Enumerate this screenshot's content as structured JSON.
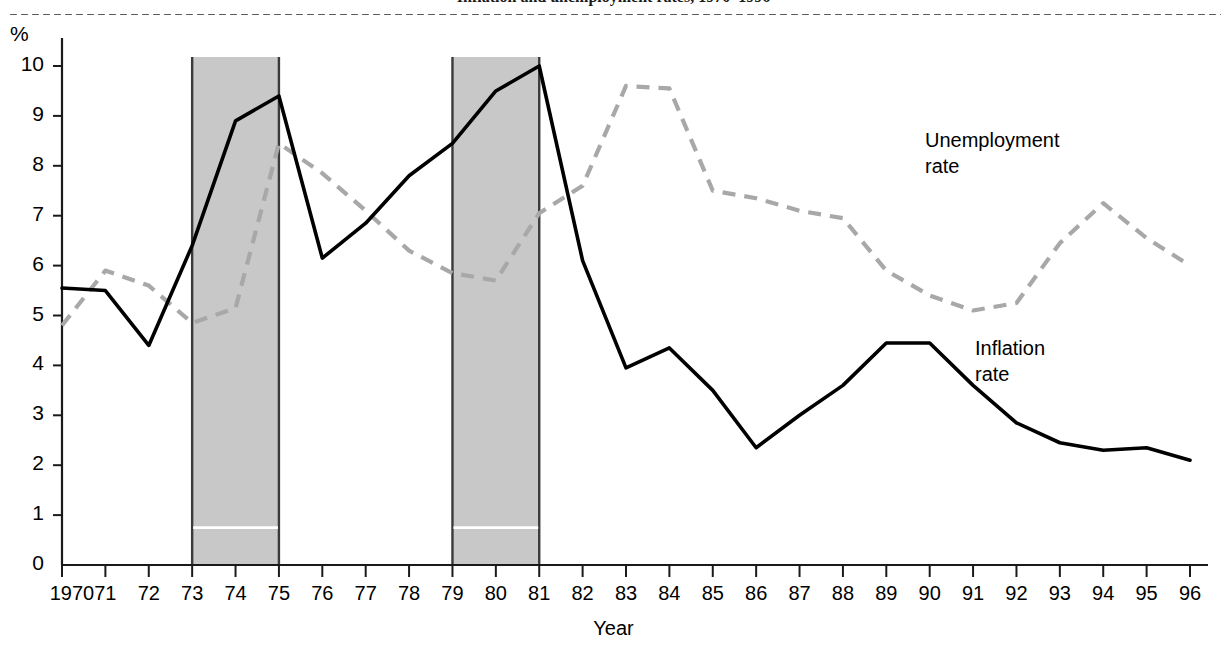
{
  "figure": {
    "title": "Inflation and unemployment rates, 1970–1996",
    "percent_symbol": "%",
    "xlabel": "Year"
  },
  "annotations": {
    "unemployment": {
      "line1": "Unemployment",
      "line2": "rate"
    },
    "inflation": {
      "line1": "Inflation",
      "line2": "rate"
    }
  },
  "colors": {
    "inflation_line": "#000000",
    "unemployment_line": "#a8a8a8",
    "recession_band": "#c8c8c8",
    "band_border": "#3a3a3a",
    "axis": "#1a1a1a",
    "band_inner_rule": "#ffffff"
  },
  "chart_data": {
    "type": "line",
    "title": "Inflation and unemployment rates, 1970–1996",
    "xlabel": "Year",
    "ylabel": "%",
    "ylim": [
      0,
      10.6
    ],
    "yticks": [
      0,
      1,
      2,
      3,
      4,
      5,
      6,
      7,
      8,
      9,
      10
    ],
    "ytick_labels": [
      "0",
      "1",
      "2",
      "3",
      "4",
      "5",
      "6",
      "7",
      "8",
      "9",
      "10"
    ],
    "xlim": [
      1970,
      1996
    ],
    "grid": false,
    "legend": "annotated-inline",
    "x": [
      1970,
      1971,
      1972,
      1973,
      1974,
      1975,
      1976,
      1977,
      1978,
      1979,
      1980,
      1981,
      1982,
      1983,
      1984,
      1985,
      1986,
      1987,
      1988,
      1989,
      1990,
      1991,
      1992,
      1993,
      1994,
      1995,
      1996
    ],
    "xtick_labels": [
      "1970",
      "71",
      "72",
      "73",
      "74",
      "75",
      "76",
      "77",
      "78",
      "79",
      "80",
      "81",
      "82",
      "83",
      "84",
      "85",
      "86",
      "87",
      "88",
      "89",
      "90",
      "91",
      "92",
      "93",
      "94",
      "95",
      "96"
    ],
    "series": [
      {
        "name": "Inflation rate",
        "style": "solid",
        "color": "#000000",
        "values": [
          5.55,
          5.5,
          4.4,
          6.4,
          8.9,
          9.4,
          6.15,
          6.85,
          7.8,
          8.45,
          9.5,
          10.0,
          6.1,
          3.95,
          4.35,
          3.5,
          2.35,
          3.0,
          3.6,
          4.45,
          4.45,
          3.6,
          2.85,
          2.45,
          2.3,
          2.35,
          2.1
        ]
      },
      {
        "name": "Unemployment rate",
        "style": "dashed",
        "color": "#a8a8a8",
        "values": [
          4.8,
          5.9,
          5.6,
          4.85,
          5.15,
          8.45,
          7.85,
          7.1,
          6.3,
          5.85,
          5.7,
          7.05,
          7.6,
          9.6,
          9.55,
          7.5,
          7.35,
          7.1,
          6.95,
          5.9,
          5.4,
          5.1,
          5.25,
          6.45,
          7.25,
          6.55,
          6.0
        ]
      }
    ],
    "shaded_regions": [
      {
        "label": "recession",
        "x_start": 1973,
        "x_end": 1975,
        "color": "#c8c8c8"
      },
      {
        "label": "recession",
        "x_start": 1979,
        "x_end": 1981,
        "color": "#c8c8c8"
      }
    ]
  }
}
